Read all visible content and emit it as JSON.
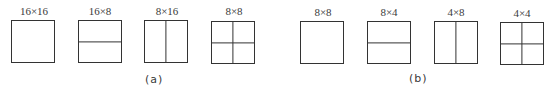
{
  "groups": [
    {
      "caption": "(a)",
      "blocks": [
        {
          "label": "16×16",
          "split": "none"
        },
        {
          "label": "16×8",
          "split": "horizontal"
        },
        {
          "label": "8×16",
          "split": "vertical"
        },
        {
          "label": "8×8",
          "split": "quad"
        }
      ]
    },
    {
      "caption": "(b)",
      "blocks": [
        {
          "label": "8×8",
          "split": "none"
        },
        {
          "label": "8×4",
          "split": "horizontal"
        },
        {
          "label": "4×8",
          "split": "vertical"
        },
        {
          "label": "4×4",
          "split": "quad"
        }
      ]
    }
  ]
}
